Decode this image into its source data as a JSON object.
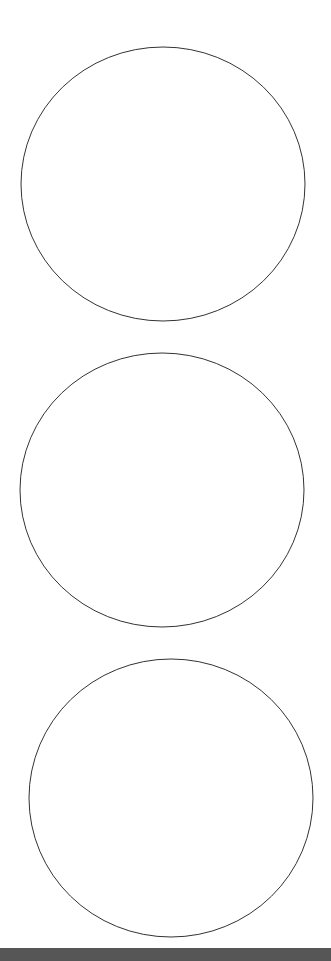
{
  "canvas": {
    "width": 331,
    "height": 961,
    "background": "#ffffff"
  },
  "shapes": [
    {
      "type": "ellipse",
      "name": "circle-1",
      "cx": 163,
      "cy": 184,
      "rx": 142,
      "ry": 137,
      "stroke": "#333333",
      "fill": "none"
    },
    {
      "type": "ellipse",
      "name": "circle-2",
      "cx": 162,
      "cy": 490,
      "rx": 142,
      "ry": 137,
      "stroke": "#333333",
      "fill": "none"
    },
    {
      "type": "ellipse",
      "name": "circle-3",
      "cx": 171,
      "cy": 798,
      "rx": 142,
      "ry": 139,
      "stroke": "#333333",
      "fill": "none"
    }
  ],
  "bottom_bar": {
    "color": "#565656"
  }
}
